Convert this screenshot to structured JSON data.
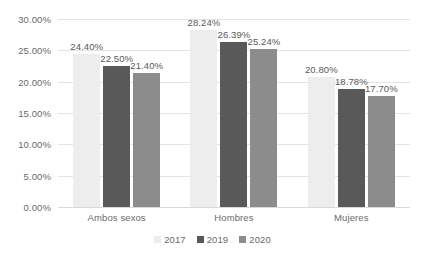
{
  "chart_data": {
    "type": "bar",
    "title": "",
    "subtitle": "",
    "xlabel": "",
    "ylabel": "",
    "categories": [
      "Ambos sexos",
      "Hombres",
      "Mujeres"
    ],
    "series": [
      {
        "name": "2017",
        "color": "#ededed",
        "values": [
          24.4,
          28.24,
          20.8
        ],
        "labels": [
          "24.40%",
          "28.24%",
          "20.80%"
        ]
      },
      {
        "name": "2019",
        "color": "#595959",
        "values": [
          22.5,
          26.39,
          18.78
        ],
        "labels": [
          "22.50%",
          "26.39%",
          "18.78%"
        ]
      },
      {
        "name": "2020",
        "color": "#8c8c8c",
        "values": [
          21.4,
          25.24,
          17.7
        ],
        "labels": [
          "21.40%",
          "25.24%",
          "17.70%"
        ]
      }
    ],
    "ylim": [
      0,
      30
    ],
    "ytick_values": [
      30,
      25,
      20,
      15,
      10,
      5,
      0
    ],
    "ytick_labels": [
      "30.00%",
      "25.00%",
      "20.00%",
      "15.00%",
      "10.00%",
      "5.00%",
      "0.00%"
    ],
    "grid": true,
    "legend_position": "bottom",
    "value_labels_shown": true,
    "unit": "%"
  },
  "axis": {
    "y": {
      "ticks": [
        {
          "label": "30.00%",
          "value": 30
        },
        {
          "label": "25.00%",
          "value": 25
        },
        {
          "label": "20.00%",
          "value": 20
        },
        {
          "label": "15.00%",
          "value": 15
        },
        {
          "label": "10.00%",
          "value": 10
        },
        {
          "label": "5.00%",
          "value": 5
        },
        {
          "label": "0.00%",
          "value": 0
        }
      ]
    },
    "x": {
      "categories": [
        "Ambos sexos",
        "Hombres",
        "Mujeres"
      ]
    }
  },
  "legend": {
    "items": [
      {
        "label": "2017",
        "color": "#ededed"
      },
      {
        "label": "2019",
        "color": "#595959"
      },
      {
        "label": "2020",
        "color": "#8c8c8c"
      }
    ]
  },
  "colors": {
    "series_2017": "#ededed",
    "series_2019": "#595959",
    "series_2020": "#8c8c8c",
    "gridline": "#e4e4e4",
    "text": "#6a6a6a",
    "label_text": "#595959",
    "background": "#ffffff"
  }
}
